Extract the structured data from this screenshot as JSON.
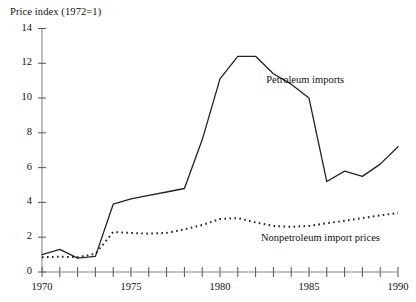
{
  "chart_data": {
    "type": "line",
    "title": "Price index (1972=1)",
    "xlabel": "",
    "ylabel": "Price index (1972=1)",
    "xlim": [
      1970,
      1990
    ],
    "ylim": [
      0,
      14
    ],
    "yticks": [
      0,
      2,
      4,
      6,
      8,
      10,
      12,
      14
    ],
    "xticks": [
      1970,
      1971,
      1972,
      1973,
      1974,
      1975,
      1976,
      1977,
      1978,
      1979,
      1980,
      1981,
      1982,
      1983,
      1984,
      1985,
      1986,
      1987,
      1988,
      1989,
      1990
    ],
    "xtick_labels_shown": [
      "1970",
      "1975",
      "1980",
      "1985",
      "1990"
    ],
    "ytick_labels_shown": [
      "0",
      "2",
      "4",
      "6",
      "8",
      "10",
      "12",
      "14"
    ],
    "grid": false,
    "legend_position": "inline-annotation",
    "x": [
      1970,
      1971,
      1972,
      1973,
      1974,
      1975,
      1976,
      1977,
      1978,
      1979,
      1980,
      1981,
      1982,
      1983,
      1984,
      1985,
      1986,
      1987,
      1988,
      1989,
      1990
    ],
    "series": [
      {
        "name": "Petroleum imports",
        "style": "solid",
        "color": "#222222",
        "label_x": 1982.6,
        "label_y": 11.0,
        "values": [
          1.0,
          1.3,
          0.8,
          0.9,
          3.9,
          4.2,
          4.4,
          4.6,
          4.8,
          7.6,
          11.1,
          12.4,
          12.4,
          11.4,
          10.8,
          10.0,
          5.2,
          5.8,
          5.5,
          6.2,
          7.2
        ]
      },
      {
        "name": "Nonpetroleum import prices",
        "style": "dotted",
        "color": "#222222",
        "label_x": 1982.3,
        "label_y": 1.9,
        "values": [
          0.85,
          0.88,
          0.85,
          1.05,
          2.3,
          2.25,
          2.2,
          2.25,
          2.45,
          2.7,
          3.05,
          3.1,
          2.85,
          2.65,
          2.6,
          2.65,
          2.8,
          2.95,
          3.1,
          3.25,
          3.4
        ]
      }
    ]
  }
}
